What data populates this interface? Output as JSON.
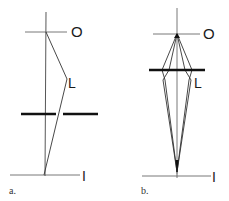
{
  "diagrams": [
    {
      "id": "a",
      "caption": "a.",
      "object_label": "O",
      "lens_label": "L",
      "image_label": "I"
    },
    {
      "id": "b",
      "caption": "b.",
      "object_label": "O",
      "lens_label": "L",
      "image_label": "I"
    }
  ],
  "colors": {
    "line": "#1a1a1a",
    "thin_line": "#555555",
    "background": "#ffffff"
  }
}
